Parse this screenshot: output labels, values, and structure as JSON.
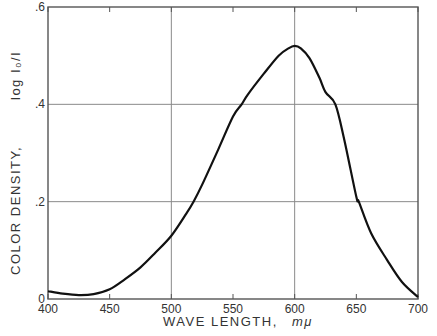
{
  "chart_data": {
    "type": "line",
    "title": "",
    "xlabel": "WAVE LENGTH,",
    "xlabel_unit": "mμ",
    "ylabel": "COLOR DENSITY,",
    "ylabel_unit": "log I₀/I",
    "xlim": [
      400,
      700
    ],
    "ylim": [
      0,
      0.6
    ],
    "x_ticks": [
      400,
      450,
      500,
      550,
      600,
      650,
      700
    ],
    "x_tick_labels": [
      "400",
      "450",
      "500",
      "550",
      "600",
      "650",
      "700"
    ],
    "y_ticks": [
      0,
      0.2,
      0.4,
      0.6
    ],
    "y_tick_labels": [
      "0",
      ".2",
      ".4",
      ".6"
    ],
    "grid": true,
    "grid_x": [
      500,
      600
    ],
    "grid_y": [
      0.2,
      0.4
    ],
    "legend": "none",
    "series": [
      {
        "name": "color density",
        "x": [
          400,
          412,
          425,
          437,
          450,
          462,
          475,
          487,
          500,
          512,
          518,
          525,
          538,
          550,
          557,
          562,
          575,
          587,
          595,
          600,
          605,
          612,
          620,
          625,
          633,
          640,
          650,
          652,
          662,
          675,
          687,
          700
        ],
        "y": [
          0.016,
          0.011,
          0.008,
          0.01,
          0.02,
          0.04,
          0.065,
          0.095,
          0.13,
          0.175,
          0.2,
          0.235,
          0.307,
          0.375,
          0.4,
          0.42,
          0.463,
          0.5,
          0.515,
          0.52,
          0.515,
          0.495,
          0.455,
          0.425,
          0.4,
          0.33,
          0.21,
          0.2,
          0.135,
          0.08,
          0.035,
          0.004
        ]
      }
    ]
  }
}
